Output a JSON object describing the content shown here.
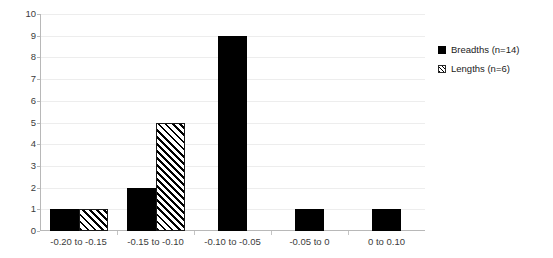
{
  "chart_data": {
    "type": "bar",
    "title": "",
    "xlabel": "",
    "ylabel": "",
    "ylim": [
      0,
      10
    ],
    "ytick_step": 1,
    "yticks": [
      "10",
      "9",
      "8",
      "7",
      "6",
      "5",
      "4",
      "3",
      "2",
      "1",
      "0"
    ],
    "grid": true,
    "legend_position": "right",
    "categories": [
      "-0.20 to -0.15",
      "-0.15 to -0.10",
      "-0.10 to -0.05",
      "-0.05 to 0",
      "0 to 0.10"
    ],
    "series": [
      {
        "name": "Breadths (n=14)",
        "pattern": "solid",
        "color": "#000000",
        "values": [
          1,
          2,
          9,
          1,
          1
        ]
      },
      {
        "name": "Lengths (n=6)",
        "pattern": "diagonal-hatch",
        "color": "#000000",
        "values": [
          1,
          5,
          0,
          0,
          0
        ]
      }
    ]
  },
  "legend": {
    "items": [
      {
        "label": "Breadths (n=14)",
        "swatch": "solid-square-icon"
      },
      {
        "label": "Lengths (n=6)",
        "swatch": "hatched-square-icon"
      }
    ]
  }
}
